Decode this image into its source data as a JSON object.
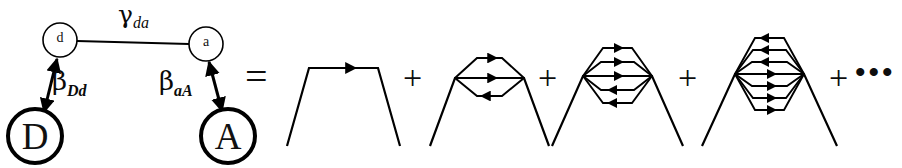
{
  "figure": {
    "type": "feynman-like-diagram-equation",
    "background_color": "#ffffff",
    "ink_color": "#000000",
    "left_graph": {
      "name": "donor-acceptor-coupling-graph",
      "nodes": [
        {
          "id": "d",
          "label": "d",
          "kind": "small-open-circle",
          "cx": 60,
          "cy": 40,
          "r": 17
        },
        {
          "id": "a",
          "label": "a",
          "kind": "small-open-circle",
          "cx": 206,
          "cy": 44,
          "r": 17
        },
        {
          "id": "D",
          "label": "D",
          "kind": "large-bold-circle",
          "cx": 35,
          "cy": 136,
          "r": 27
        },
        {
          "id": "A",
          "label": "A",
          "kind": "large-bold-circle",
          "cx": 228,
          "cy": 136,
          "r": 27
        }
      ],
      "edges": [
        {
          "id": "d-a",
          "from": "d",
          "to": "a",
          "label": "γ",
          "label_sub": "da",
          "arrow": "none"
        },
        {
          "id": "D-d",
          "from": "D",
          "to": "d",
          "label": "β",
          "label_sub": "Dd",
          "arrow": "double"
        },
        {
          "id": "a-A",
          "from": "a",
          "to": "A",
          "label": "β",
          "label_sub": "aA",
          "arrow": "double"
        }
      ]
    },
    "equals_sign": "=",
    "plus_sign": "+",
    "ellipsis": "•••",
    "series_terms": [
      {
        "order": 1,
        "name": "term-1-bridge",
        "internal_lines": 1,
        "arrows": [
          "right"
        ]
      },
      {
        "order": 2,
        "name": "term-2-bridge",
        "internal_lines": 3,
        "arrows": [
          "right",
          "right",
          "left"
        ]
      },
      {
        "order": 3,
        "name": "term-3-bridge",
        "internal_lines": 5,
        "arrows": [
          "right",
          "right",
          "right",
          "left",
          "left"
        ]
      },
      {
        "order": 4,
        "name": "term-4-bridge",
        "internal_lines": 7,
        "arrows": [
          "left",
          "left",
          "left",
          "right",
          "right",
          "right",
          "right"
        ]
      }
    ],
    "labels": {
      "gamma_da_base": "γ",
      "gamma_da_sub": "da",
      "beta_Dd_base": "β",
      "beta_Dd_sub": "Dd",
      "beta_aA_base": "β",
      "beta_aA_sub": "aA",
      "node_d": "d",
      "node_a": "a",
      "node_D": "D",
      "node_A": "A"
    }
  }
}
